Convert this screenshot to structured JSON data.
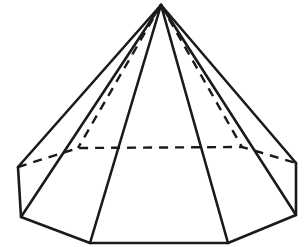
{
  "figure": {
    "title": "Decagonal pyramid",
    "canvas": {
      "width": 307,
      "height": 247
    },
    "background_color": "#ffffff",
    "line_color": "#1a1a1a",
    "fill_color": "#ffffff",
    "stroke_width_visible": 2.6,
    "stroke_width_hidden": 2.4,
    "hidden_dash_pattern": "9 7"
  },
  "geometry": {
    "apex": {
      "name": "apex",
      "x": 161,
      "y": 5
    },
    "base_vertices_front": [
      {
        "name": "base-left-upper",
        "x": 18,
        "y": 167
      },
      {
        "name": "base-left-lower",
        "x": 21,
        "y": 217
      },
      {
        "name": "base-front-left",
        "x": 90,
        "y": 243
      },
      {
        "name": "base-front-right",
        "x": 228,
        "y": 243
      },
      {
        "name": "base-right-lower",
        "x": 296,
        "y": 215
      },
      {
        "name": "base-right-upper",
        "x": 296,
        "y": 163
      }
    ],
    "base_vertices_back": [
      {
        "name": "base-back-left",
        "x": 78,
        "y": 148
      },
      {
        "name": "base-back-right",
        "x": 242,
        "y": 147
      }
    ],
    "base_edges_visible": [
      {
        "name": "edge-base-left-side",
        "from": "base-left-upper",
        "to": "base-left-lower"
      },
      {
        "name": "edge-base-lower-left",
        "from": "base-left-lower",
        "to": "base-front-left"
      },
      {
        "name": "edge-base-front",
        "from": "base-front-left",
        "to": "base-front-right"
      },
      {
        "name": "edge-base-lower-right",
        "from": "base-front-right",
        "to": "base-right-lower"
      },
      {
        "name": "edge-base-right-side",
        "from": "base-right-lower",
        "to": "base-right-upper"
      }
    ],
    "base_edges_hidden": [
      {
        "name": "edge-base-back-upper-left",
        "from": "base-left-upper",
        "to": "base-back-left"
      },
      {
        "name": "edge-base-back-middle",
        "from": "base-back-left",
        "to": "base-back-right"
      },
      {
        "name": "edge-base-back-upper-right",
        "from": "base-back-right",
        "to": "base-right-upper"
      }
    ],
    "lateral_edges_visible": [
      {
        "name": "lateral-edge-to-left-upper",
        "from": "apex",
        "to": "base-left-upper"
      },
      {
        "name": "lateral-edge-to-left-lower",
        "from": "apex",
        "to": "base-left-lower"
      },
      {
        "name": "lateral-edge-to-front-left",
        "from": "apex",
        "to": "base-front-left"
      },
      {
        "name": "lateral-edge-to-front-right",
        "from": "apex",
        "to": "base-front-right"
      },
      {
        "name": "lateral-edge-to-right-lower",
        "from": "apex",
        "to": "base-right-lower"
      },
      {
        "name": "lateral-edge-to-right-upper",
        "from": "apex",
        "to": "base-right-upper"
      }
    ],
    "lateral_edges_hidden": [
      {
        "name": "lateral-edge-to-back-left",
        "from": "apex",
        "to": "base-back-left"
      },
      {
        "name": "lateral-edge-to-back-right",
        "from": "apex",
        "to": "base-back-right"
      }
    ]
  },
  "paths": {
    "body_outline": "M 161 5 L 18 167 L 21 217 L 90 243 L 228 243 L 296 215 L 296 163 Z",
    "base_front_chain": "M 18 167 L 21 217 L 90 243 L 228 243 L 296 215 L 296 163",
    "base_back_chain": "M 18 167 L 78 148 L 242 147 L 296 163",
    "lateral_left_upper": "M 161 5 L 18 167",
    "lateral_left_lower": "M 161 5 L 21 217",
    "lateral_front_left": "M 161 5 L 90 243",
    "lateral_front_right": "M 161 5 L 228 243",
    "lateral_right_lower": "M 161 5 L 296 215",
    "lateral_right_upper": "M 161 5 L 296 163",
    "lateral_back_left": "M 161 5 L 78 148",
    "lateral_back_right": "M 161 5 L 242 147"
  }
}
